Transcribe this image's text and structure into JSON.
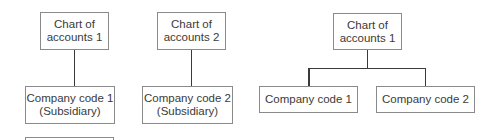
{
  "left_diagram": {
    "chart1": {
      "line1": "Chart of",
      "line2": "accounts 1"
    },
    "company1": {
      "line1": "Company code 1",
      "line2": "(Subsidiary)"
    },
    "chart2": {
      "line1": "Chart of",
      "line2": "accounts 2"
    },
    "company2": {
      "line1": "Company code 2",
      "line2": "(Subsidiary)"
    }
  },
  "right_diagram": {
    "chart": {
      "line1": "Chart of",
      "line2": "accounts 1"
    },
    "company1": {
      "label": "Company code 1"
    },
    "company2": {
      "label": "Company code 2"
    }
  }
}
